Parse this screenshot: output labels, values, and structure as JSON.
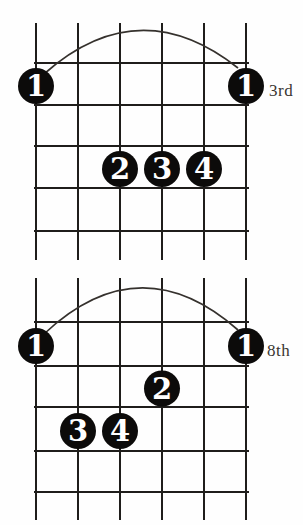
{
  "page": {
    "background": "#fefefe",
    "ink_color": "#1f1d1b",
    "dot_color": "#0c0b0a",
    "digit_color": "#ffffff"
  },
  "diagrams": [
    {
      "id": "chord-diagram-top",
      "position_label": "3rd",
      "string_count": 6,
      "fret_lines_shown": 5,
      "barre": {
        "finger": "1",
        "fret_space": 1,
        "from_string": 1,
        "to_string": 6
      },
      "dots": [
        {
          "finger": "1",
          "string": 1,
          "fret_space": 1
        },
        {
          "finger": "1",
          "string": 6,
          "fret_space": 1
        },
        {
          "finger": "2",
          "string": 3,
          "fret_space": 3
        },
        {
          "finger": "3",
          "string": 4,
          "fret_space": 3
        },
        {
          "finger": "4",
          "string": 5,
          "fret_space": 3
        }
      ]
    },
    {
      "id": "chord-diagram-bottom",
      "position_label": "8th",
      "string_count": 6,
      "fret_lines_shown": 5,
      "barre": {
        "finger": "1",
        "fret_space": 1,
        "from_string": 1,
        "to_string": 6
      },
      "dots": [
        {
          "finger": "1",
          "string": 1,
          "fret_space": 1
        },
        {
          "finger": "1",
          "string": 6,
          "fret_space": 1
        },
        {
          "finger": "2",
          "string": 4,
          "fret_space": 2
        },
        {
          "finger": "3",
          "string": 2,
          "fret_space": 3
        },
        {
          "finger": "4",
          "string": 3,
          "fret_space": 3
        }
      ]
    }
  ]
}
